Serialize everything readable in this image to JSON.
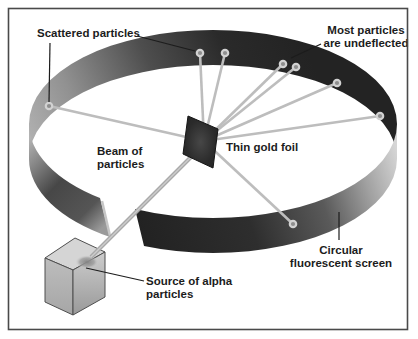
{
  "figure": {
    "labels": {
      "scattered": "Scattered particles",
      "undeflected_line1": "Most particles",
      "undeflected_line2": "are undeflected",
      "foil": "Thin gold foil",
      "beam_line1": "Beam of",
      "beam_line2": "particles",
      "source_line1": "Source of alpha",
      "source_line2": "particles",
      "screen_line1": "Circular",
      "screen_line2": "fluorescent screen"
    },
    "colors": {
      "band_dark": "#232323",
      "band_light": "#d6d6d6",
      "ray": "#bdbdbd",
      "dot_outer": "#d2d2d2",
      "dot_inner": "#8e8e8e",
      "beam_base": "#a9a9a9",
      "beam_highlight": "#cccccc",
      "text": "#1c1c1c",
      "frame": "#4a4a4a"
    },
    "diagram": {
      "foil_origin": {
        "x": 204,
        "y": 141
      },
      "hits": [
        {
          "x": 49,
          "y": 106
        },
        {
          "x": 200,
          "y": 53
        },
        {
          "x": 225,
          "y": 53
        },
        {
          "x": 283,
          "y": 64
        },
        {
          "x": 296,
          "y": 67
        },
        {
          "x": 337,
          "y": 83
        },
        {
          "x": 380,
          "y": 116
        },
        {
          "x": 293,
          "y": 224
        }
      ],
      "beam": {
        "x1": 91,
        "y1": 257,
        "x2": 202,
        "y2": 146
      }
    }
  }
}
